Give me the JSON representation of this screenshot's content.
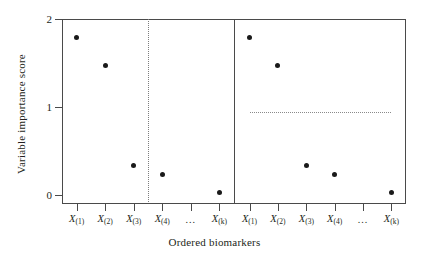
{
  "chart_data": {
    "type": "scatter",
    "title": "",
    "xlabel": "Ordered biomarkers",
    "ylabel": "Variable importance score",
    "ylim": [
      0,
      2
    ],
    "yticks": [
      0,
      1,
      2
    ],
    "ytick_labels": [
      "0",
      "1",
      "2"
    ],
    "grid": false,
    "legend": "none",
    "xtick_labels": [
      "X(1)",
      "X(2)",
      "X(3)",
      "X(4)",
      "...",
      "X(k)"
    ],
    "xtick_bases": [
      "X",
      "X",
      "X",
      "X",
      "",
      "X"
    ],
    "xtick_subs": [
      "(1)",
      "(2)",
      "(3)",
      "(4)",
      "",
      "(k)"
    ],
    "panels": [
      {
        "name": "left-panel",
        "categories": [
          "X(1)",
          "X(2)",
          "X(3)",
          "X(4)",
          "X(k)"
        ],
        "x_slots": [
          1,
          2,
          3,
          4,
          6
        ],
        "values": [
          1.8,
          1.5,
          0.42,
          0.32,
          0.12
        ],
        "annotation_type": "vertical-cutoff-line",
        "annotation_style": "dotted",
        "annotation_x_slot": 3.5,
        "annotation_label": ""
      },
      {
        "name": "right-panel",
        "categories": [
          "X(1)",
          "X(2)",
          "X(3)",
          "X(4)",
          "X(k)"
        ],
        "x_slots": [
          1,
          2,
          3,
          4,
          6
        ],
        "values": [
          1.8,
          1.5,
          0.42,
          0.32,
          0.12
        ],
        "annotation_type": "horizontal-threshold-line",
        "annotation_style": "dotted",
        "annotation_y": 1,
        "annotation_label": ""
      }
    ],
    "colors": {
      "point": "#1a1a1a",
      "axis": "#4a4a4a",
      "reference_line": "#8a8a8a",
      "background": "#ffffff"
    }
  },
  "axes": {
    "y_title": "Variable importance score",
    "x_title": "Ordered biomarkers",
    "y_tick_0": "0",
    "y_tick_1": "1",
    "y_tick_2": "2"
  },
  "ticks": {
    "t1_base": "X",
    "t1_sub": "(1)",
    "t2_base": "X",
    "t2_sub": "(2)",
    "t3_base": "X",
    "t3_sub": "(3)",
    "t4_base": "X",
    "t4_sub": "(4)",
    "t5_dots": "...",
    "t6_base": "X",
    "t6_sub": "(k)"
  }
}
